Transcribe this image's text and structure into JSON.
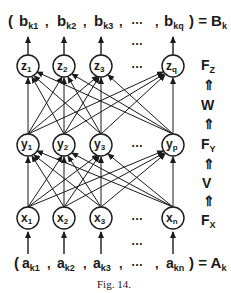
{
  "figure": {
    "caption": "Fig. 14.",
    "output_vector": {
      "open": "(",
      "items": [
        {
          "base": "b",
          "sub": "k1"
        },
        {
          "base": "b",
          "sub": "k2"
        },
        {
          "base": "b",
          "sub": "k3"
        },
        {
          "base": "b",
          "sub": "kq"
        }
      ],
      "ellipsis": "…",
      "close": ") = ",
      "result": {
        "base": "B",
        "sub": "k"
      }
    },
    "input_vector": {
      "open": "(",
      "items": [
        {
          "base": "a",
          "sub": "k1"
        },
        {
          "base": "a",
          "sub": "k2"
        },
        {
          "base": "a",
          "sub": "k3"
        },
        {
          "base": "a",
          "sub": "kn"
        }
      ],
      "ellipsis": "…",
      "close": ") = ",
      "result": {
        "base": "A",
        "sub": "k"
      }
    },
    "layers": [
      {
        "name": "z",
        "field": {
          "base": "F",
          "sub": "Z"
        },
        "nodes": [
          {
            "base": "z",
            "sub": "1"
          },
          {
            "base": "z",
            "sub": "2"
          },
          {
            "base": "z",
            "sub": "3"
          },
          {
            "base": "z",
            "sub": "q"
          }
        ]
      },
      {
        "name": "y",
        "field": {
          "base": "F",
          "sub": "Y"
        },
        "nodes": [
          {
            "base": "y",
            "sub": "1"
          },
          {
            "base": "y",
            "sub": "2"
          },
          {
            "base": "y",
            "sub": "3"
          },
          {
            "base": "y",
            "sub": "p"
          }
        ]
      },
      {
        "name": "x",
        "field": {
          "base": "F",
          "sub": "X"
        },
        "nodes": [
          {
            "base": "x",
            "sub": "1"
          },
          {
            "base": "x",
            "sub": "2"
          },
          {
            "base": "x",
            "sub": "3"
          },
          {
            "base": "x",
            "sub": "n"
          }
        ]
      }
    ],
    "weights": {
      "upper": "W",
      "lower": "V"
    },
    "double_arrow": "⇑",
    "ellipsis": "…"
  }
}
